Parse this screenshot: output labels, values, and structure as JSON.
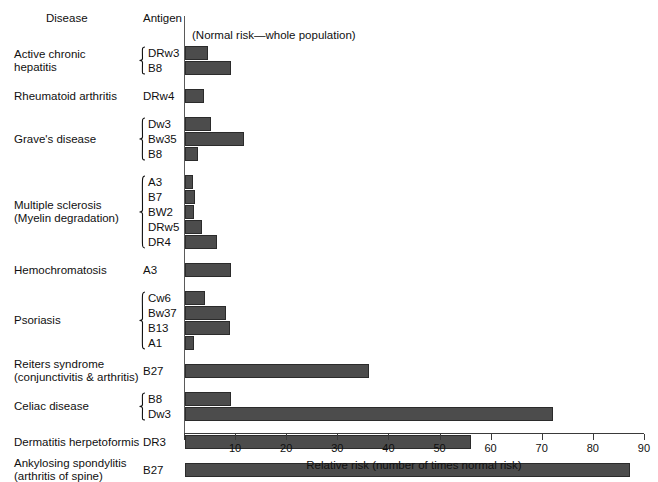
{
  "headers": {
    "disease": "Disease",
    "antigen": "Antigen",
    "note": "(Normal risk—whole population)"
  },
  "axis": {
    "xlabel": "Relative risk (number of times normal risk)",
    "ticks": [
      0,
      10,
      20,
      30,
      40,
      50,
      60,
      70,
      80,
      90
    ],
    "tick_labels": [
      "",
      "10",
      "20",
      "30",
      "40",
      "50",
      "60",
      "70",
      "80",
      "90"
    ],
    "min": 0,
    "max": 90
  },
  "colors": {
    "bar_fill": "#4c4c4c",
    "bar_stroke": "#2b2b2b",
    "axis": "#3a3a3a",
    "text": "#101010",
    "background": "#ffffff"
  },
  "chart_data": {
    "type": "bar",
    "orientation": "horizontal",
    "title": "",
    "xlabel": "Relative risk (number of times normal risk)",
    "ylabel": "Disease / Antigen",
    "xlim": [
      0,
      90
    ],
    "grid": false,
    "legend": null,
    "annotations": [
      "(Normal risk—whole population)"
    ],
    "groups": [
      {
        "disease": "Active chronic\nhepatitis",
        "braced": true,
        "rows": [
          {
            "antigen": "DRw3",
            "value": 4.5
          },
          {
            "antigen": "B8",
            "value": 9.0
          }
        ]
      },
      {
        "disease": "Rheumatoid arthritis",
        "braced": false,
        "rows": [
          {
            "antigen": "DRw4",
            "value": 3.8
          }
        ]
      },
      {
        "disease": "Grave's disease",
        "braced": true,
        "rows": [
          {
            "antigen": "Dw3",
            "value": 5.0
          },
          {
            "antigen": "Bw35",
            "value": 11.5
          },
          {
            "antigen": "B8",
            "value": 2.5
          }
        ]
      },
      {
        "disease": "Multiple sclerosis\n(Myelin degradation)",
        "braced": true,
        "rows": [
          {
            "antigen": "A3",
            "value": 1.5
          },
          {
            "antigen": "B7",
            "value": 2.0
          },
          {
            "antigen": "BW2",
            "value": 1.8
          },
          {
            "antigen": "DRw5",
            "value": 3.3
          },
          {
            "antigen": "DR4",
            "value": 6.3
          }
        ]
      },
      {
        "disease": "Hemochromatosis",
        "braced": false,
        "rows": [
          {
            "antigen": "A3",
            "value": 9.0
          }
        ]
      },
      {
        "disease": "Psoriasis",
        "braced": true,
        "rows": [
          {
            "antigen": "Cw6",
            "value": 4.0
          },
          {
            "antigen": "Bw37",
            "value": 8.0
          },
          {
            "antigen": "B13",
            "value": 8.8
          },
          {
            "antigen": "A1",
            "value": 1.8
          }
        ]
      },
      {
        "disease": "Reiters syndrome\n(conjunctivitis & arthritis)",
        "braced": false,
        "rows": [
          {
            "antigen": "B27",
            "value": 36.0
          }
        ]
      },
      {
        "disease": "Celiac disease",
        "braced": true,
        "rows": [
          {
            "antigen": "B8",
            "value": 9.0
          },
          {
            "antigen": "Dw3",
            "value": 72.0
          }
        ]
      },
      {
        "disease": "Dermatitis herpetoformis",
        "braced": false,
        "rows": [
          {
            "antigen": "DR3",
            "value": 56.0
          }
        ]
      },
      {
        "disease": "Ankylosing spondylitis\n(arthritis of spine)",
        "braced": false,
        "rows": [
          {
            "antigen": "B27",
            "value": 87.0
          }
        ]
      }
    ]
  }
}
